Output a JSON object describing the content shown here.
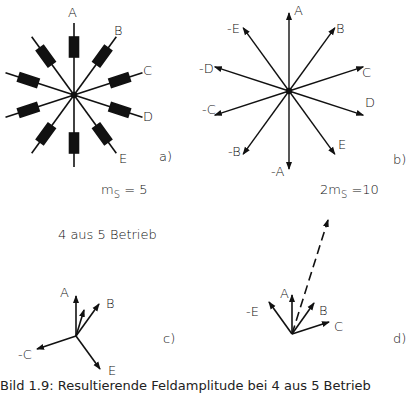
{
  "figure": {
    "panels": {
      "a": {
        "tag": "a)",
        "formula": "m",
        "formula_sub": "S",
        "formula_rest": " = 5",
        "labels": [
          "A",
          "B",
          "C",
          "D",
          "E"
        ]
      },
      "b": {
        "tag": "b)",
        "formula_pre": "2m",
        "formula_sub": "S",
        "formula_rest": " =10",
        "labels": [
          "A",
          "B",
          "C",
          "D",
          "E",
          "-A",
          "-B",
          "-C",
          "-D",
          "-E"
        ]
      },
      "c": {
        "tag": "c)",
        "labels": [
          "A",
          "B",
          "-C",
          "E"
        ]
      },
      "d": {
        "tag": "d)",
        "labels": [
          "-E",
          "A",
          "B",
          "C"
        ]
      }
    },
    "mode_label": "4 aus 5  Betrieb",
    "caption": "Bild 1.9:  Resultierende Feldamplitude bei 4 aus 5 Betrieb"
  }
}
